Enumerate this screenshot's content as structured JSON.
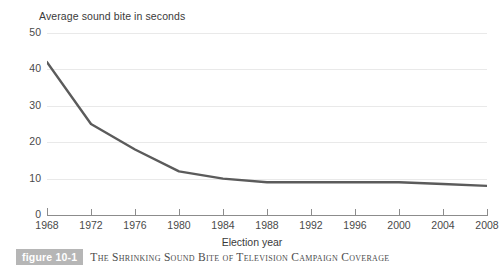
{
  "figure": {
    "badge_label": "figure 10-1",
    "caption": "The Shrinking Sound Bite of Television Campaign Coverage"
  },
  "chart_data": {
    "type": "line",
    "title": "",
    "ylabel": "Average sound bite in seconds",
    "xlabel": "Election year",
    "categories": [
      "1968",
      "1972",
      "1976",
      "1980",
      "1984",
      "1988",
      "1992",
      "1996",
      "2000",
      "2004",
      "2008"
    ],
    "x": [
      1968,
      1972,
      1976,
      1980,
      1984,
      1988,
      1992,
      1996,
      2000,
      2004,
      2008
    ],
    "values": [
      42,
      25,
      18,
      12,
      10,
      9,
      9,
      9,
      9,
      8.5,
      8
    ],
    "series": [
      {
        "name": "Average sound bite in seconds",
        "values": [
          42,
          25,
          18,
          12,
          10,
          9,
          9,
          9,
          9,
          8.5,
          8
        ]
      }
    ],
    "ylim": [
      0,
      50
    ],
    "yticks": [
      0,
      10,
      20,
      30,
      40,
      50
    ],
    "ytick_labels": [
      "0",
      "10",
      "20",
      "30",
      "40",
      "50"
    ],
    "xlim": [
      1968,
      2008
    ],
    "xticks": [
      1968,
      1972,
      1976,
      1980,
      1984,
      1988,
      1992,
      1996,
      2000,
      2004,
      2008
    ],
    "grid": "horizontal",
    "legend": "none",
    "line_color": "#5b5b5b",
    "grid_color": "#e9e9e9",
    "axis_color": "#8c8c8c"
  }
}
